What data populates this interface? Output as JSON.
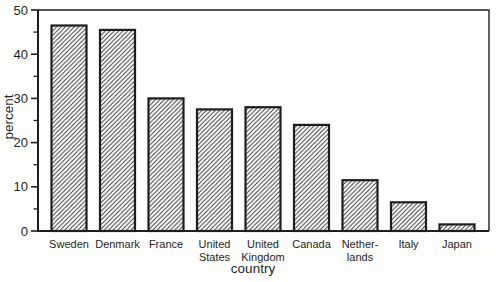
{
  "chart_data": {
    "type": "bar",
    "title": "",
    "xlabel": "country",
    "ylabel": "percent",
    "categories": [
      "Sweden",
      "Denmark",
      "France",
      "United States",
      "United Kingdom",
      "Canada",
      "Netherlands",
      "Italy",
      "Japan"
    ],
    "category_label_lines": [
      [
        "Sweden"
      ],
      [
        "Denmark"
      ],
      [
        "France"
      ],
      [
        "United",
        "States"
      ],
      [
        "United",
        "Kingdom"
      ],
      [
        "Canada"
      ],
      [
        "Nether-",
        "lands"
      ],
      [
        "Italy"
      ],
      [
        "Japan"
      ]
    ],
    "values": [
      46.5,
      45.5,
      30,
      27.5,
      28,
      24,
      11.5,
      6.5,
      1.5
    ],
    "ylim": [
      0,
      50
    ],
    "yticks_major": [
      0,
      10,
      20,
      30,
      40,
      50
    ],
    "yticks_minor": [
      5,
      15,
      25,
      35,
      45
    ],
    "bar_fill": "diagonal-hatch",
    "line_color": "#1e1e1e",
    "hatch_color": "#2e2e2e",
    "background_color": "#fdfdfc",
    "grid": "off",
    "legend": "none"
  }
}
